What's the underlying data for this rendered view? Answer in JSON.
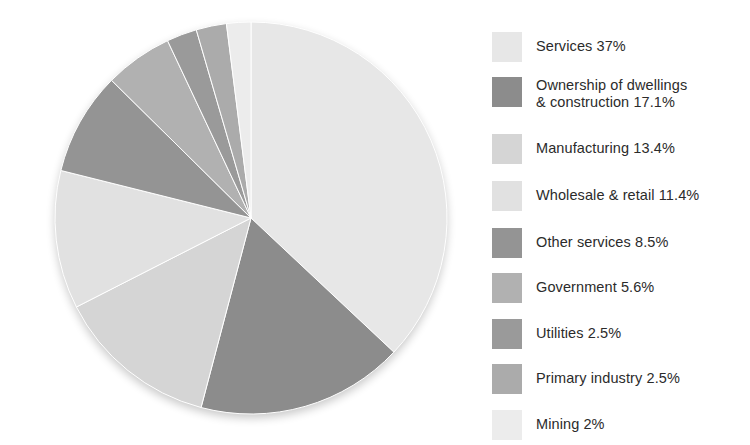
{
  "chart_data": {
    "type": "pie",
    "title": "",
    "subtitle": "",
    "xlabel": "",
    "ylabel": "",
    "legend_position": "right",
    "grid": false,
    "start_angle_deg": 0,
    "direction": "clockwise",
    "center": {
      "x": 251,
      "y": 218
    },
    "radius": 196,
    "units": "percent",
    "total": 100,
    "categories": [
      "Services",
      "Ownership of dwellings & construction",
      "Manufacturing",
      "Wholesale & retail",
      "Other services",
      "Government",
      "Utilities",
      "Primary industry",
      "Mining"
    ],
    "values": [
      37,
      17.1,
      13.4,
      11.4,
      8.5,
      5.6,
      2.5,
      2.5,
      2
    ],
    "colors": [
      "#e7e7e7",
      "#8c8c8c",
      "#d5d5d5",
      "#e1e1e1",
      "#949494",
      "#b1b1b1",
      "#9a9a9a",
      "#ababab",
      "#ececec"
    ],
    "slices": [
      {
        "label": "Services",
        "value": 37,
        "value_text": "37%",
        "color": "#e7e7e7",
        "start_deg": 0.0,
        "end_deg": 133.2
      },
      {
        "label": "Ownership of dwellings & construction",
        "value": 17.1,
        "value_text": "17.1%",
        "color": "#8c8c8c",
        "start_deg": 133.2,
        "end_deg": 194.76
      },
      {
        "label": "Manufacturing",
        "value": 13.4,
        "value_text": "13.4%",
        "color": "#d5d5d5",
        "start_deg": 194.76,
        "end_deg": 242.99
      },
      {
        "label": "Wholesale & retail",
        "value": 11.4,
        "value_text": "11.4%",
        "color": "#e1e1e1",
        "start_deg": 242.99,
        "end_deg": 284.03
      },
      {
        "label": "Other services",
        "value": 8.5,
        "value_text": "8.5%",
        "color": "#949494",
        "start_deg": 284.03,
        "end_deg": 314.63
      },
      {
        "label": "Government",
        "value": 5.6,
        "value_text": "5.6%",
        "color": "#b1b1b1",
        "start_deg": 314.63,
        "end_deg": 334.79
      },
      {
        "label": "Utilities",
        "value": 2.5,
        "value_text": "2.5%",
        "color": "#9a9a9a",
        "start_deg": 334.79,
        "end_deg": 343.79
      },
      {
        "label": "Primary industry",
        "value": 2.5,
        "value_text": "2.5%",
        "color": "#ababab",
        "start_deg": 343.79,
        "end_deg": 352.79
      },
      {
        "label": "Mining",
        "value": 2,
        "value_text": "2%",
        "color": "#ececec",
        "start_deg": 352.79,
        "end_deg": 360.0
      }
    ]
  },
  "legend": {
    "items": [
      {
        "text": "Services 37%",
        "color": "#e7e7e7",
        "y": 18,
        "two_line": false
      },
      {
        "text": "Ownership of dwellings\n& construction 17.1%",
        "color": "#8c8c8c",
        "y": 63,
        "two_line": true
      },
      {
        "text": "Manufacturing 13.4%",
        "color": "#d5d5d5",
        "y": 120,
        "two_line": false
      },
      {
        "text": "Wholesale & retail 11.4%",
        "color": "#e1e1e1",
        "y": 167,
        "two_line": false
      },
      {
        "text": "Other services 8.5%",
        "color": "#949494",
        "y": 214,
        "two_line": false
      },
      {
        "text": "Government 5.6%",
        "color": "#b1b1b1",
        "y": 259,
        "two_line": false
      },
      {
        "text": "Utilities 2.5%",
        "color": "#9a9a9a",
        "y": 305,
        "two_line": false
      },
      {
        "text": "Primary industry 2.5%",
        "color": "#ababab",
        "y": 350,
        "two_line": false
      },
      {
        "text": "Mining 2%",
        "color": "#ececec",
        "y": 396,
        "two_line": false
      }
    ]
  }
}
